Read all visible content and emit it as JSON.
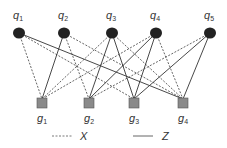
{
  "diagram": {
    "colors": {
      "top_node": "#222222",
      "bottom_node_fill": "#8a8a8a",
      "bottom_node_stroke": "#555555",
      "edge": "#333333",
      "text": "#333333"
    },
    "top_nodes": [
      {
        "id": "q1",
        "base": "q",
        "sub": "1",
        "x": 19,
        "y": 33
      },
      {
        "id": "q2",
        "base": "q",
        "sub": "2",
        "x": 64,
        "y": 33
      },
      {
        "id": "q3",
        "base": "q",
        "sub": "3",
        "x": 112,
        "y": 33
      },
      {
        "id": "q4",
        "base": "q",
        "sub": "4",
        "x": 156,
        "y": 33
      },
      {
        "id": "q5",
        "base": "q",
        "sub": "5",
        "x": 210,
        "y": 33
      }
    ],
    "bottom_nodes": [
      {
        "id": "g1",
        "base": "g",
        "sub": "1",
        "x": 42,
        "y": 103
      },
      {
        "id": "g2",
        "base": "g",
        "sub": "2",
        "x": 89,
        "y": 103
      },
      {
        "id": "g3",
        "base": "g",
        "sub": "3",
        "x": 134,
        "y": 103
      },
      {
        "id": "g4",
        "base": "g",
        "sub": "4",
        "x": 183,
        "y": 103
      }
    ],
    "edges": [
      {
        "from": "q1",
        "to": "g1",
        "type": "X"
      },
      {
        "from": "q1",
        "to": "g3",
        "type": "X"
      },
      {
        "from": "q1",
        "to": "g4",
        "type": "Z"
      },
      {
        "from": "q2",
        "to": "g1",
        "type": "Z"
      },
      {
        "from": "q2",
        "to": "g2",
        "type": "X"
      },
      {
        "from": "q2",
        "to": "g4",
        "type": "X"
      },
      {
        "from": "q3",
        "to": "g1",
        "type": "X"
      },
      {
        "from": "q3",
        "to": "g2",
        "type": "Z"
      },
      {
        "from": "q3",
        "to": "g3",
        "type": "Z"
      },
      {
        "from": "q3",
        "to": "g4",
        "type": "X"
      },
      {
        "from": "q4",
        "to": "g1",
        "type": "X"
      },
      {
        "from": "q4",
        "to": "g2",
        "type": "Z"
      },
      {
        "from": "q4",
        "to": "g3",
        "type": "Z"
      },
      {
        "from": "q4",
        "to": "g4",
        "type": "X"
      },
      {
        "from": "q5",
        "to": "g2",
        "type": "X"
      },
      {
        "from": "q5",
        "to": "g3",
        "type": "Z"
      },
      {
        "from": "q5",
        "to": "g4",
        "type": "Z"
      }
    ],
    "legend": {
      "items": [
        {
          "label": "X",
          "style": "dashed"
        },
        {
          "label": "Z",
          "style": "solid"
        }
      ]
    }
  }
}
